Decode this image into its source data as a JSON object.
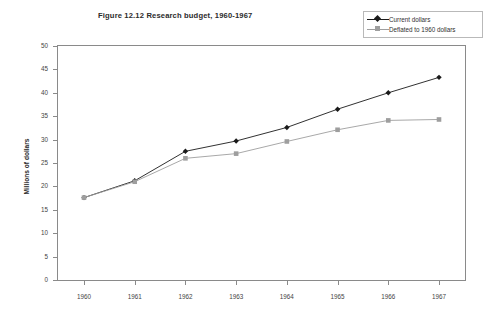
{
  "chart_data": {
    "type": "line",
    "title": "Figure 12.12 Research budget, 1960-1967",
    "xlabel": "",
    "ylabel": "Millions of dollars",
    "categories": [
      "1960",
      "1961",
      "1962",
      "1963",
      "1964",
      "1965",
      "1966",
      "1967"
    ],
    "x": [
      1960,
      1961,
      1962,
      1963,
      1964,
      1965,
      1966,
      1967
    ],
    "ylim": [
      0,
      50
    ],
    "yticks": [
      0,
      5,
      10,
      15,
      20,
      25,
      30,
      35,
      40,
      45,
      50
    ],
    "ytick_labels": [
      "0",
      "5",
      "10",
      "15",
      "20",
      "25",
      "30",
      "35",
      "40",
      "45",
      "50"
    ],
    "grid": false,
    "legend_position": "top-right",
    "series": [
      {
        "name": "Current dollars",
        "values": [
          17.6,
          21.2,
          27.5,
          29.7,
          32.6,
          36.5,
          40.0,
          43.3
        ],
        "color": "#1a1a1a",
        "marker": "diamond"
      },
      {
        "name": "Deflated to 1960 dollars",
        "values": [
          17.6,
          21.0,
          26.0,
          27.0,
          29.6,
          32.1,
          34.1,
          34.3
        ],
        "color": "#9e9e9e",
        "marker": "square"
      }
    ]
  },
  "colors": {
    "axis": "#8a8a8a",
    "text": "#3a3a3a",
    "background": "#ffffff",
    "legend_border": "#b9b9b9"
  }
}
